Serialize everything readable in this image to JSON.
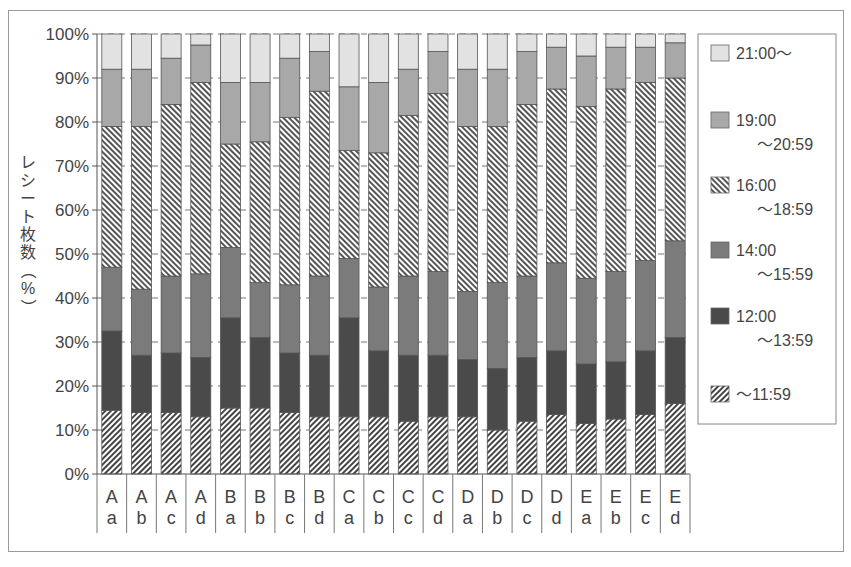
{
  "chart_data": {
    "type": "bar",
    "stacked": true,
    "percent_stacked": true,
    "title": "",
    "xlabel": "",
    "ylabel": "レシート枚数（%）",
    "ylim": [
      0,
      100
    ],
    "yticks": [
      "0%",
      "10%",
      "20%",
      "30%",
      "40%",
      "50%",
      "60%",
      "70%",
      "80%",
      "90%",
      "100%"
    ],
    "grid": "horizontal dashed",
    "legend_position": "right",
    "categories": [
      {
        "top": "A",
        "bottom": "a"
      },
      {
        "top": "A",
        "bottom": "b"
      },
      {
        "top": "A",
        "bottom": "c"
      },
      {
        "top": "A",
        "bottom": "d"
      },
      {
        "top": "B",
        "bottom": "a"
      },
      {
        "top": "B",
        "bottom": "b"
      },
      {
        "top": "B",
        "bottom": "c"
      },
      {
        "top": "B",
        "bottom": "d"
      },
      {
        "top": "C",
        "bottom": "a"
      },
      {
        "top": "C",
        "bottom": "b"
      },
      {
        "top": "C",
        "bottom": "c"
      },
      {
        "top": "C",
        "bottom": "d"
      },
      {
        "top": "D",
        "bottom": "a"
      },
      {
        "top": "D",
        "bottom": "b"
      },
      {
        "top": "D",
        "bottom": "c"
      },
      {
        "top": "D",
        "bottom": "d"
      },
      {
        "top": "E",
        "bottom": "a"
      },
      {
        "top": "E",
        "bottom": "b"
      },
      {
        "top": "E",
        "bottom": "c"
      },
      {
        "top": "E",
        "bottom": "d"
      }
    ],
    "series": [
      {
        "name": "～11:59",
        "pattern": "hatch-back",
        "color": "#555555",
        "values": [
          14.5,
          14,
          14,
          13,
          15,
          15,
          14,
          13,
          13,
          13,
          12,
          13,
          13,
          10,
          12,
          13.5,
          11.5,
          12.5,
          13.5,
          16
        ]
      },
      {
        "name": "12:00～13:59",
        "pattern": "solid",
        "color": "#4a4a4a",
        "values": [
          18,
          13,
          13.5,
          13.5,
          20.5,
          16,
          13.5,
          14,
          22.5,
          15,
          15,
          14,
          13,
          14,
          14.5,
          14.5,
          13.5,
          13,
          14.5,
          15
        ]
      },
      {
        "name": "14:00～15:59",
        "pattern": "solid",
        "color": "#7b7b7b",
        "values": [
          14.5,
          15,
          17.5,
          19,
          16,
          12.5,
          15.5,
          18,
          13.5,
          14.5,
          18,
          19,
          15.5,
          19.5,
          18.5,
          20,
          19.5,
          20.5,
          20.5,
          22
        ]
      },
      {
        "name": "16:00～18:59",
        "pattern": "hatch-forward",
        "color": "#555555",
        "values": [
          32,
          37,
          39,
          43.5,
          23.5,
          32,
          38,
          42,
          24.5,
          30.5,
          36.5,
          40.5,
          37.5,
          35.5,
          39,
          39.5,
          39,
          41.5,
          40.5,
          37
        ]
      },
      {
        "name": "19:00～20:59",
        "pattern": "solid",
        "color": "#a8a8a8",
        "values": [
          13,
          13,
          10.5,
          8.5,
          14,
          13.5,
          13.5,
          9,
          14.5,
          16,
          10.5,
          9.5,
          13,
          13,
          12,
          9.5,
          11.5,
          9.5,
          8,
          8
        ]
      },
      {
        "name": "21:00～",
        "pattern": "solid",
        "color": "#e2e2e2",
        "values": [
          8,
          8,
          5.5,
          2.5,
          11,
          11,
          5.5,
          4,
          12,
          11,
          8,
          4,
          8,
          8,
          4,
          3,
          5,
          3,
          3,
          2
        ]
      }
    ]
  },
  "legend": {
    "items": [
      {
        "line1": "21:00～",
        "line2": ""
      },
      {
        "line1": "19:00",
        "line2": "～20:59"
      },
      {
        "line1": "16:00",
        "line2": "～18:59"
      },
      {
        "line1": "14:00",
        "line2": "～15:59"
      },
      {
        "line1": "12:00",
        "line2": "～13:59"
      },
      {
        "line1": "～11:59",
        "line2": ""
      }
    ]
  },
  "axis": {
    "ylabel_chars": [
      "レ",
      "シ",
      "ー",
      "ト",
      "枚",
      "数",
      "（",
      "%",
      "）"
    ]
  }
}
